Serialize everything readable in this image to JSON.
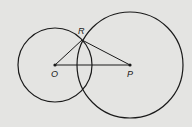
{
  "diagram": {
    "background": "#e4e4e2",
    "stroke_color": "#1a1a1a",
    "points": {
      "O": {
        "label": "O",
        "x": 55,
        "y": 65
      },
      "P": {
        "label": "P",
        "x": 130,
        "y": 65
      },
      "R": {
        "label": "R",
        "x": 82,
        "y": 40
      }
    },
    "circles": [
      {
        "name": "circle-O",
        "center": "O",
        "r": 37
      },
      {
        "name": "circle-P",
        "center": "P",
        "r": 53
      }
    ],
    "segments": [
      [
        "O",
        "R"
      ],
      [
        "R",
        "P"
      ],
      [
        "O",
        "P"
      ]
    ]
  }
}
